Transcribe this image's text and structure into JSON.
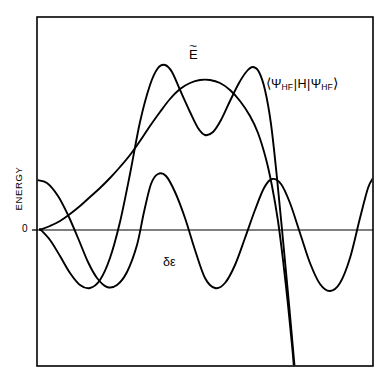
{
  "figure": {
    "type": "scientific-line-plot",
    "background_color": "#ffffff",
    "stroke_color": "#000000"
  },
  "axes": {
    "y_axis_title": "ENERGY",
    "y_zero_tick": "0",
    "x_axis_title": "",
    "frame": {
      "left": 37,
      "top": 17,
      "right": 373,
      "bottom": 366
    },
    "zero_line_y": 230
  },
  "labels": {
    "e_tilde": {
      "base": "E",
      "accent": "~",
      "full": "Ẽ"
    },
    "expectation": {
      "open_bracket": "⟨",
      "psi": "Ψ",
      "subscript": "HF",
      "bar": "|",
      "hamiltonian": "H",
      "close_bracket": "⟩",
      "full": "⟨ΨHF|H|ΨHF⟩"
    },
    "delta_epsilon": {
      "full": "δε"
    }
  },
  "chart_data": {
    "type": "line",
    "title": "",
    "xlabel": "",
    "ylabel": "ENERGY",
    "grid": false,
    "legend": "inline-annotations",
    "xlim": [
      37,
      373
    ],
    "ylim_pixels": [
      17,
      366
    ],
    "zero_level": 230,
    "series": [
      {
        "name": "δε",
        "label": "delta-epsilon",
        "description": "oscillating curve, begins at a crest on the left frame edge, dips below zero, rises to interior crests, and returns to a crest at the right frame edge",
        "points": [
          [
            37,
            180
          ],
          [
            47,
            183
          ],
          [
            58,
            196
          ],
          [
            68,
            215
          ],
          [
            78,
            238
          ],
          [
            88,
            262
          ],
          [
            97,
            278
          ],
          [
            107,
            287
          ],
          [
            117,
            285
          ],
          [
            127,
            272
          ],
          [
            137,
            245
          ],
          [
            144,
            212
          ],
          [
            151,
            184
          ],
          [
            158,
            174
          ],
          [
            166,
            176
          ],
          [
            175,
            192
          ],
          [
            185,
            218
          ],
          [
            195,
            250
          ],
          [
            205,
            278
          ],
          [
            215,
            288
          ],
          [
            225,
            283
          ],
          [
            235,
            265
          ],
          [
            245,
            238
          ],
          [
            255,
            210
          ],
          [
            264,
            188
          ],
          [
            272,
            179
          ],
          [
            281,
            184
          ],
          [
            290,
            203
          ],
          [
            300,
            233
          ],
          [
            310,
            263
          ],
          [
            320,
            284
          ],
          [
            330,
            291
          ],
          [
            340,
            283
          ],
          [
            350,
            258
          ],
          [
            360,
            218
          ],
          [
            368,
            188
          ],
          [
            373,
            178
          ]
        ]
      },
      {
        "name": "⟨ΨHF|H|ΨHF⟩",
        "label": "expectation-value-curve",
        "description": "W-shaped curve: rises steeply from near zero at the left, two tall crests separated by a central dip, then plunges steeply off the bottom of the frame",
        "points": [
          [
            40,
            229
          ],
          [
            50,
            240
          ],
          [
            60,
            256
          ],
          [
            70,
            273
          ],
          [
            80,
            285
          ],
          [
            90,
            288
          ],
          [
            100,
            280
          ],
          [
            110,
            258
          ],
          [
            120,
            222
          ],
          [
            130,
            174
          ],
          [
            140,
            122
          ],
          [
            150,
            85
          ],
          [
            158,
            68
          ],
          [
            165,
            65
          ],
          [
            172,
            72
          ],
          [
            180,
            90
          ],
          [
            190,
            112
          ],
          [
            198,
            128
          ],
          [
            205,
            135
          ],
          [
            213,
            132
          ],
          [
            221,
            120
          ],
          [
            230,
            101
          ],
          [
            239,
            83
          ],
          [
            247,
            71
          ],
          [
            253,
            67
          ],
          [
            259,
            72
          ],
          [
            265,
            90
          ],
          [
            271,
            124
          ],
          [
            277,
            178
          ],
          [
            283,
            240
          ],
          [
            289,
            304
          ],
          [
            294,
            360
          ],
          [
            296,
            380
          ]
        ]
      },
      {
        "name": "Ẽ",
        "label": "e-tilde-curve",
        "description": "smooth curve emerging from the origin region, rising gently then arcing over a broad central maximum before descending steeply off the bottom of the frame",
        "points": [
          [
            40,
            230
          ],
          [
            50,
            226
          ],
          [
            60,
            221
          ],
          [
            70,
            214
          ],
          [
            80,
            206
          ],
          [
            90,
            197
          ],
          [
            100,
            188
          ],
          [
            110,
            178
          ],
          [
            120,
            167
          ],
          [
            130,
            155
          ],
          [
            140,
            141
          ],
          [
            150,
            126
          ],
          [
            160,
            112
          ],
          [
            170,
            99
          ],
          [
            180,
            89
          ],
          [
            190,
            83
          ],
          [
            200,
            80
          ],
          [
            210,
            80
          ],
          [
            220,
            83
          ],
          [
            230,
            90
          ],
          [
            240,
            101
          ],
          [
            250,
            116
          ],
          [
            258,
            133
          ],
          [
            266,
            159
          ],
          [
            272,
            186
          ],
          [
            278,
            221
          ],
          [
            283,
            260
          ],
          [
            288,
            305
          ],
          [
            292,
            345
          ],
          [
            295,
            380
          ]
        ]
      }
    ]
  }
}
